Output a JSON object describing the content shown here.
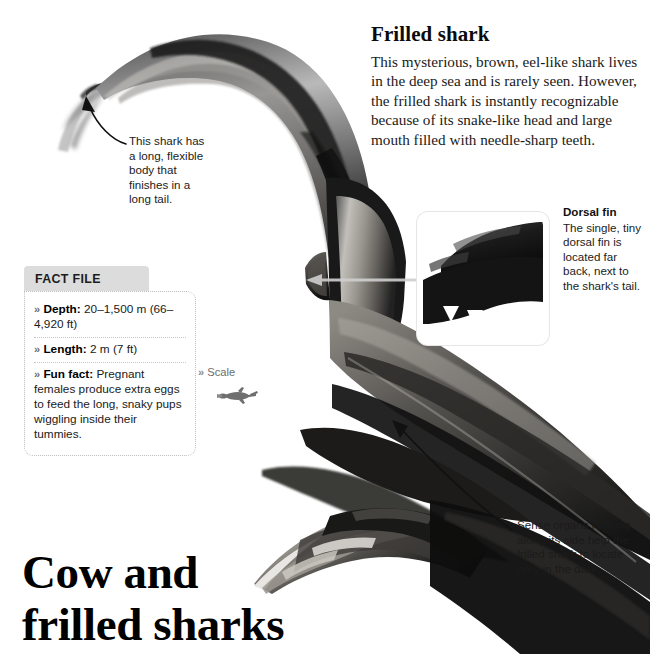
{
  "headline": "Frilled shark",
  "intro": "This mysterious, brown, eel-like shark lives in the deep sea and is rarely seen. However, the frilled shark is instantly recognizable because of its snake-like head and large mouth filled with needle-sharp teeth.",
  "big_title": {
    "line1": "Cow and",
    "line2": "frilled sharks"
  },
  "callouts": {
    "tail": "This shark has a long, flexible body that finishes in a long tail.",
    "dorsal": {
      "title": "Dorsal fin",
      "text": "The single, tiny dorsal fin is located far back, next to the shark's tail."
    },
    "sense": "Sense organs running along its side help the frilled shark to locate prey in the dark."
  },
  "fact_file": {
    "tab_label": "FACT FILE",
    "chevron": "»",
    "rows": [
      {
        "label": "Depth:",
        "value": " 20–1,500 m (66–4,920 ft)"
      },
      {
        "label": "Length:",
        "value": " 2 m (7 ft)"
      },
      {
        "label": "Fun fact:",
        "value": " Pregnant females produce extra eggs to feed the long, snaky pups wiggling inside their tummies."
      }
    ]
  },
  "scale": {
    "chevron": "»",
    "label": "Scale"
  },
  "colors": {
    "tab_bg": "#dcdcdc",
    "text": "#1a1a1a",
    "scale_gray": "#6d6d6d",
    "border_dotted": "#bdbdbd"
  }
}
